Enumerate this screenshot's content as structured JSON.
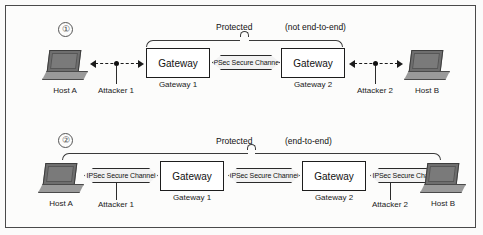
{
  "figure": {
    "background_color": "#fcfcfb",
    "border_color": "#4a4a4a"
  },
  "panels": [
    {
      "index_marker": "①",
      "brace": {
        "label": "Protected",
        "qualifier": "(not end-to-end)",
        "scope": "gateway-to-gateway"
      },
      "nodes": {
        "host_left": "Host A",
        "gateway_left_title": "Gateway",
        "gateway_left_caption": "Gateway 1",
        "gateway_right_title": "Gateway",
        "gateway_right_caption": "Gateway 2",
        "host_right": "Host B"
      },
      "attackers": [
        {
          "label": "Attacker 1"
        },
        {
          "label": "Attacker 2"
        }
      ],
      "links": [
        {
          "kind": "dashed",
          "label": ""
        },
        {
          "kind": "ipsec",
          "label": "IPSec Secure Channel"
        },
        {
          "kind": "dashed",
          "label": ""
        }
      ]
    },
    {
      "index_marker": "②",
      "brace": {
        "label": "Protected",
        "qualifier": "(end-to-end)",
        "scope": "host-to-host"
      },
      "nodes": {
        "host_left": "Host A",
        "gateway_left_title": "Gateway",
        "gateway_left_caption": "Gateway 1",
        "gateway_right_title": "Gateway",
        "gateway_right_caption": "Gateway 2",
        "host_right": "Host B"
      },
      "attackers": [
        {
          "label": "Attacker 1"
        },
        {
          "label": "Attacker 2"
        }
      ],
      "links": [
        {
          "kind": "ipsec",
          "label": "IPSec Secure Channel"
        },
        {
          "kind": "ipsec",
          "label": "IPSec Secure Channel"
        },
        {
          "kind": "ipsec",
          "label": "IPSec Secure Channel"
        }
      ]
    }
  ]
}
